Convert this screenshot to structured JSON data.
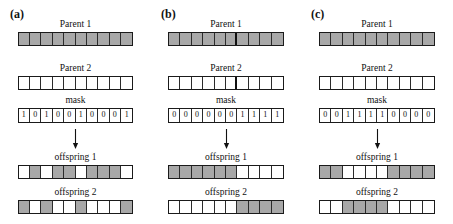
{
  "figure": {
    "caption_labels": {
      "parent1": "Parent 1",
      "parent2": "Parent 2",
      "mask": "mask",
      "offspring1": "offspring 1",
      "offspring2": "offspring 2"
    },
    "colors": {
      "gray_gene": "#a8a8a8",
      "white_gene": "#ffffff",
      "outline": "#1a1a1a",
      "background": "#ffffff"
    },
    "gene_count": 10
  },
  "panels": [
    {
      "tag": "(a)",
      "type": "uniform-crossover",
      "parent1_label": "Parent 1",
      "parent2_label": "Parent 2",
      "mask_label": "mask",
      "offspring1_label": "offspring 1",
      "offspring2_label": "offspring 2",
      "parent1": [
        "gray",
        "gray",
        "gray",
        "gray",
        "gray",
        "gray",
        "gray",
        "gray",
        "gray",
        "gray"
      ],
      "parent2": [
        "white",
        "white",
        "white",
        "white",
        "white",
        "white",
        "white",
        "white",
        "white",
        "white"
      ],
      "mask": [
        1,
        0,
        1,
        0,
        0,
        1,
        0,
        0,
        0,
        1
      ],
      "offspring1": [
        "white",
        "gray",
        "white",
        "gray",
        "gray",
        "white",
        "gray",
        "gray",
        "gray",
        "white"
      ],
      "offspring2": [
        "gray",
        "white",
        "gray",
        "white",
        "white",
        "gray",
        "white",
        "white",
        "white",
        "gray"
      ],
      "split_after": null
    },
    {
      "tag": "(b)",
      "type": "single-point-crossover",
      "parent1_label": "Parent 1",
      "parent2_label": "Parent 2",
      "mask_label": "mask",
      "offspring1_label": "offspring 1",
      "offspring2_label": "offspring 2",
      "parent1": [
        "gray",
        "gray",
        "gray",
        "gray",
        "gray",
        "gray",
        "gray",
        "gray",
        "gray",
        "gray"
      ],
      "parent2": [
        "white",
        "white",
        "white",
        "white",
        "white",
        "white",
        "white",
        "white",
        "white",
        "white"
      ],
      "mask": [
        0,
        0,
        0,
        0,
        0,
        0,
        1,
        1,
        1,
        1
      ],
      "offspring1": [
        "gray",
        "gray",
        "gray",
        "gray",
        "gray",
        "gray",
        "white",
        "white",
        "white",
        "white"
      ],
      "offspring2": [
        "white",
        "white",
        "white",
        "white",
        "white",
        "white",
        "gray",
        "gray",
        "gray",
        "gray"
      ],
      "split_after": 6
    },
    {
      "tag": "(c)",
      "type": "two-point-crossover",
      "parent1_label": "Parent 1",
      "parent2_label": "Parent 2",
      "mask_label": "mask",
      "offspring1_label": "offspring 1",
      "offspring2_label": "offspring 2",
      "parent1": [
        "gray",
        "gray",
        "gray",
        "gray",
        "gray",
        "gray",
        "gray",
        "gray",
        "gray",
        "gray"
      ],
      "parent2": [
        "white",
        "white",
        "white",
        "white",
        "white",
        "white",
        "white",
        "white",
        "white",
        "white"
      ],
      "mask": [
        0,
        0,
        1,
        1,
        1,
        1,
        0,
        0,
        0,
        0
      ],
      "offspring1": [
        "gray",
        "gray",
        "white",
        "white",
        "white",
        "white",
        "gray",
        "gray",
        "gray",
        "gray"
      ],
      "offspring2": [
        "white",
        "white",
        "gray",
        "gray",
        "gray",
        "gray",
        "white",
        "white",
        "white",
        "white"
      ],
      "split_after": null
    }
  ]
}
